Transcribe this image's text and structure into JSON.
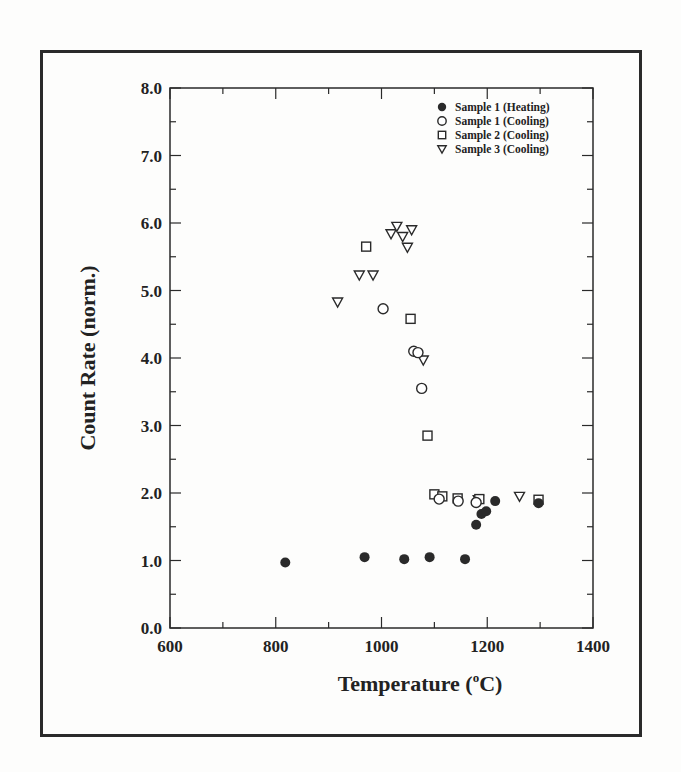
{
  "chart_data": {
    "type": "scatter",
    "title": "",
    "xlabel": "Temperature (°C)",
    "xlabel_main": "Temperature (",
    "xlabel_sup": "o",
    "xlabel_tail": "C)",
    "ylabel": "Count Rate (norm.)",
    "xlim": [
      600,
      1400
    ],
    "ylim": [
      0,
      8
    ],
    "xticks": [
      "600",
      "800",
      "1000",
      "1200",
      "1400"
    ],
    "yticks": [
      "0.0",
      "1.0",
      "2.0",
      "3.0",
      "4.0",
      "5.0",
      "6.0",
      "7.0",
      "8.0"
    ],
    "grid": false,
    "legend_position": "upper right (inside)",
    "series": [
      {
        "name": "Sample 1 (Heating)",
        "marker": "filled-circle",
        "points": [
          [
            818,
            0.97
          ],
          [
            968,
            1.05
          ],
          [
            1043,
            1.02
          ],
          [
            1091,
            1.05
          ],
          [
            1158,
            1.02
          ],
          [
            1179,
            1.53
          ],
          [
            1189,
            1.69
          ],
          [
            1198,
            1.73
          ],
          [
            1215,
            1.88
          ],
          [
            1297,
            1.85
          ]
        ]
      },
      {
        "name": "Sample 1 (Cooling)",
        "marker": "open-circle",
        "points": [
          [
            1003,
            4.73
          ],
          [
            1061,
            4.1
          ],
          [
            1069,
            4.08
          ],
          [
            1076,
            3.55
          ],
          [
            1109,
            1.91
          ],
          [
            1145,
            1.88
          ],
          [
            1179,
            1.86
          ]
        ]
      },
      {
        "name": "Sample 2 (Cooling)",
        "marker": "open-square",
        "points": [
          [
            971,
            5.65
          ],
          [
            1055,
            4.58
          ],
          [
            1087,
            2.85
          ],
          [
            1100,
            1.98
          ],
          [
            1115,
            1.95
          ],
          [
            1144,
            1.92
          ],
          [
            1185,
            1.91
          ],
          [
            1297,
            1.9
          ]
        ]
      },
      {
        "name": "Sample 3 (Cooling)",
        "marker": "open-triangle-down",
        "points": [
          [
            917,
            4.83
          ],
          [
            958,
            5.23
          ],
          [
            984,
            5.23
          ],
          [
            1018,
            5.84
          ],
          [
            1029,
            5.95
          ],
          [
            1040,
            5.8
          ],
          [
            1049,
            5.64
          ],
          [
            1057,
            5.9
          ],
          [
            1079,
            3.97
          ],
          [
            1183,
            1.9
          ],
          [
            1261,
            1.95
          ]
        ]
      }
    ]
  }
}
